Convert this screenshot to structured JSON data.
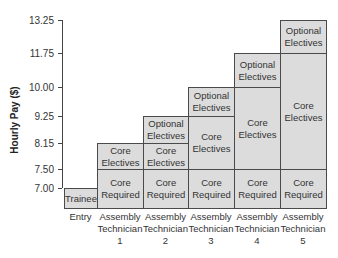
{
  "chart_data": {
    "type": "bar",
    "subtype": "stacked-step",
    "title": "",
    "xlabel": "",
    "ylabel": "Hourly Pay ($)",
    "y_ticks": [
      7.0,
      7.5,
      8.15,
      9.25,
      10.0,
      11.75,
      13.25
    ],
    "y_tick_labels": [
      "7.00",
      "7.50",
      "8.15",
      "9.25",
      "10.00",
      "11.75",
      "13.25"
    ],
    "categories": [
      "Entry",
      "Assembly Technician 1",
      "Assembly Technician 2",
      "Assembly Technician 3",
      "Assembly Technician 4",
      "Assembly Technician 5"
    ],
    "category_lines": [
      [
        "Entry"
      ],
      [
        "Assembly",
        "Technician",
        "1"
      ],
      [
        "Assembly",
        "Technician",
        "2"
      ],
      [
        "Assembly",
        "Technician",
        "3"
      ],
      [
        "Assembly",
        "Technician",
        "4"
      ],
      [
        "Assembly",
        "Technician",
        "5"
      ]
    ],
    "segments": [
      [
        {
          "label": "Trainee",
          "from": 6.5,
          "to": 7.0
        }
      ],
      [
        {
          "label": "Core Required",
          "from": 6.5,
          "to": 7.5
        },
        {
          "label": "Core Electives",
          "from": 7.5,
          "to": 8.15
        }
      ],
      [
        {
          "label": "Core Required",
          "from": 6.5,
          "to": 7.5
        },
        {
          "label": "Core Electives",
          "from": 7.5,
          "to": 8.15
        },
        {
          "label": "Optional Electives",
          "from": 8.15,
          "to": 9.25
        }
      ],
      [
        {
          "label": "Core Required",
          "from": 6.5,
          "to": 7.5
        },
        {
          "label": "Core Electives",
          "from": 7.5,
          "to": 9.25
        },
        {
          "label": "Optional Electives",
          "from": 9.25,
          "to": 10.0
        }
      ],
      [
        {
          "label": "Core Required",
          "from": 6.5,
          "to": 7.5
        },
        {
          "label": "Core Electives",
          "from": 7.5,
          "to": 10.0
        },
        {
          "label": "Optional Electives",
          "from": 10.0,
          "to": 11.75
        }
      ],
      [
        {
          "label": "Core Required",
          "from": 6.5,
          "to": 7.5
        },
        {
          "label": "Core Electives",
          "from": 7.5,
          "to": 11.75
        },
        {
          "label": "Optional Electives",
          "from": 11.75,
          "to": 13.25
        }
      ]
    ],
    "max_values": [
      7.0,
      8.15,
      9.25,
      10.0,
      11.75,
      13.25
    ],
    "grid": false,
    "legend": null,
    "colors": {
      "fill": "#dcdcdc",
      "border": "#4a4a4a",
      "axis": "#444444"
    }
  }
}
